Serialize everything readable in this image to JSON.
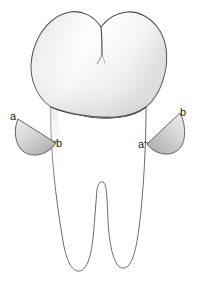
{
  "figure": {
    "name": "molar-tooth-diagram",
    "background_color": "#ffffff",
    "outline_color": "#3f3f3f",
    "crown_fill_light": "#ffffff",
    "crown_fill_shade": "#dcdcdc",
    "root_fill": "#ffffff",
    "wedge_fill_light": "#e2e2e2",
    "wedge_fill_dark": "#b4b4b4",
    "wedge_outline_color": "#555555",
    "label_color": "#1a1a1a"
  },
  "parts": {
    "crown": {
      "name": "crown",
      "cusp_count": 2,
      "fissure": "central-occlusal-groove"
    },
    "cervical_line": {
      "name": "cementoenamel-junction",
      "shape": "wavy"
    },
    "roots": {
      "name": "bifurcated-roots",
      "count": 2,
      "furcation": "central-notch"
    }
  },
  "labels": [
    {
      "id": "left-a",
      "text": "a",
      "x": 10,
      "y": 120,
      "anchor": "start",
      "side": "left",
      "points_to": "left-wedge-outer-tip"
    },
    {
      "id": "left-b",
      "text": "b",
      "x": 54,
      "y": 147,
      "anchor": "start",
      "side": "left",
      "points_to": "left-wedge-inner-point"
    },
    {
      "id": "right-a",
      "text": "a",
      "x": 139,
      "y": 148,
      "anchor": "start",
      "side": "right",
      "points_to": "right-wedge-inner-point"
    },
    {
      "id": "right-b",
      "text": "b",
      "x": 180,
      "y": 116,
      "anchor": "start",
      "side": "right",
      "points_to": "right-wedge-outer-tip"
    }
  ],
  "wedges": [
    {
      "id": "left-wedge",
      "name": "left-flap",
      "tip_label": "a",
      "contact_label": "b"
    },
    {
      "id": "right-wedge",
      "name": "right-flap",
      "tip_label": "b",
      "contact_label": "a"
    }
  ]
}
